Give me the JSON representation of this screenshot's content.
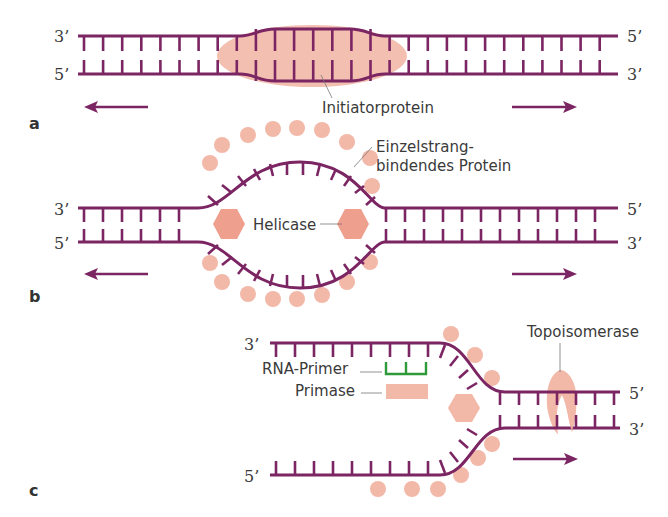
{
  "colors": {
    "strand": "#7b2563",
    "protein": "#f2b8a8",
    "protein_dark": "#ee9f8d",
    "primer": "#2e9a3a",
    "text": "#3a3a3a",
    "leader": "#777777"
  },
  "panels": [
    {
      "id": "a",
      "label": "a",
      "left_top_end": "3’",
      "left_bottom_end": "5’",
      "right_top_end": "5’",
      "right_bottom_end": "3’",
      "annotations": [
        {
          "text": "Initiatorprotein"
        }
      ]
    },
    {
      "id": "b",
      "label": "b",
      "left_top_end": "3’",
      "left_bottom_end": "5’",
      "right_top_end": "5’",
      "right_bottom_end": "3’",
      "annotations": [
        {
          "text": "Helicase"
        },
        {
          "text": "Einzelstrang-"
        },
        {
          "text": "bindendes Protein"
        }
      ]
    },
    {
      "id": "c",
      "label": "c",
      "left_top_end": "3’",
      "left_bottom_end": "5’",
      "right_top_end": "5’",
      "right_bottom_end": "3’",
      "annotations": [
        {
          "text": "RNA-Primer"
        },
        {
          "text": "Primase"
        },
        {
          "text": "Topoisomerase"
        }
      ]
    }
  ]
}
